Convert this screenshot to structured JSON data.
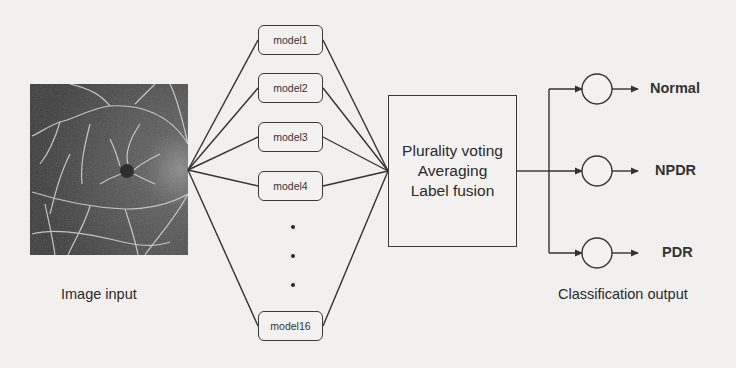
{
  "diagram": {
    "input": {
      "caption": "Image input",
      "image_description": "retinal OCT angiography image"
    },
    "models": [
      {
        "label": "model1"
      },
      {
        "label": "model2"
      },
      {
        "label": "model3"
      },
      {
        "label": "model4"
      },
      {
        "label": "model16"
      }
    ],
    "ellipsis": "...",
    "fusion": {
      "lines": [
        "Plurality voting",
        "Averaging",
        "Label fusion"
      ]
    },
    "outputs": [
      {
        "label": "Normal"
      },
      {
        "label": "NPDR"
      },
      {
        "label": "PDR"
      }
    ],
    "output_caption": "Classification output",
    "colors": {
      "line": "#333333",
      "background": "#f1f0ee",
      "box_border": "#3a3a3a"
    }
  }
}
